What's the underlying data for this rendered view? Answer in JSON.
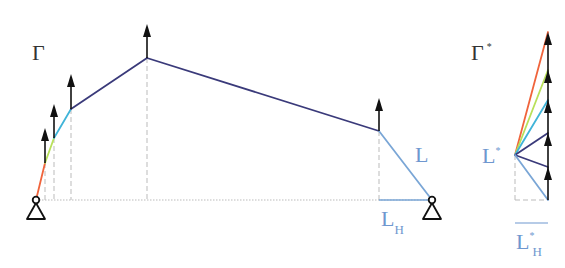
{
  "diagram": {
    "left": {
      "title": "Γ",
      "label_L": "L",
      "label_LH_main": "L",
      "label_LH_sub": "H",
      "supports": [
        {
          "x": 36,
          "y": 200
        },
        {
          "x": 432,
          "y": 200
        }
      ],
      "segments": [
        {
          "from": [
            36,
            200
          ],
          "to": [
            45,
            163
          ],
          "color": "#f0643c"
        },
        {
          "from": [
            45,
            163
          ],
          "to": [
            54,
            138
          ],
          "color": "#b8e05a"
        },
        {
          "from": [
            54,
            138
          ],
          "to": [
            71,
            109
          ],
          "color": "#40b4d8"
        },
        {
          "from": [
            71,
            109
          ],
          "to": [
            147,
            58
          ],
          "color": "#3a3a7a"
        },
        {
          "from": [
            147,
            58
          ],
          "to": [
            379,
            131
          ],
          "color": "#3a3a7a"
        },
        {
          "from": [
            379,
            131
          ],
          "to": [
            432,
            200
          ],
          "color": "#7aa6d6"
        }
      ],
      "arrows": [
        {
          "x": 45,
          "base": 163,
          "tip": 128
        },
        {
          "x": 54,
          "base": 138,
          "tip": 104
        },
        {
          "x": 71,
          "base": 109,
          "tip": 74
        },
        {
          "x": 147,
          "base": 58,
          "tip": 24
        },
        {
          "x": 379,
          "base": 131,
          "tip": 98
        }
      ],
      "dashed_verticals": [
        45,
        54,
        71,
        147,
        379
      ],
      "baseline_y": 200,
      "LH_line": {
        "x1": 379,
        "x2": 432,
        "y": 200,
        "color": "#7aa6d6"
      }
    },
    "right": {
      "title": "Γ",
      "title_sup": "*",
      "pole_label": "L",
      "pole_label_sup": "*",
      "LH_label_main": "L",
      "LH_label_sup": "*",
      "LH_label_sub": "H",
      "pole": [
        515,
        155
      ],
      "load_line_x": 548,
      "load_points": [
        {
          "y": 32,
          "color": "#f0643c"
        },
        {
          "y": 70,
          "color": "#b8e05a"
        },
        {
          "y": 100,
          "color": "#40b4d8"
        },
        {
          "y": 133,
          "color": "#3a3a7a"
        },
        {
          "y": 167,
          "color": "#3a3a7a"
        },
        {
          "y": 200,
          "color": "#7aa6d6"
        }
      ],
      "arrow_positions": [
        {
          "from": 200,
          "to": 167
        },
        {
          "from": 167,
          "to": 133
        },
        {
          "from": 133,
          "to": 100
        },
        {
          "from": 100,
          "to": 70
        },
        {
          "from": 70,
          "to": 32
        }
      ]
    },
    "colors": {
      "ink": "#111111",
      "dashed": "#bbbbbb",
      "label_blue": "#6f97cf",
      "label_dark": "#333333"
    }
  }
}
